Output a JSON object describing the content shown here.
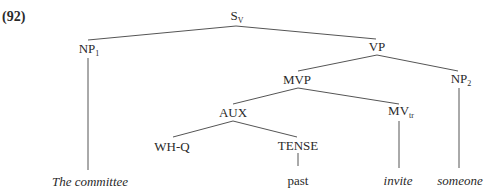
{
  "example_number": "(92)",
  "nodes": {
    "S": {
      "base": "S",
      "sub": "V"
    },
    "NP1": {
      "base": "NP",
      "sub": "1"
    },
    "VP": {
      "base": "VP",
      "sub": ""
    },
    "MVP": {
      "base": "MVP",
      "sub": ""
    },
    "NP2": {
      "base": "NP",
      "sub": "2"
    },
    "AUX": {
      "base": "AUX",
      "sub": ""
    },
    "MVtr": {
      "base": "MV",
      "sub": "tr"
    },
    "WHQ": {
      "base": "WH-Q",
      "sub": ""
    },
    "TENSE": {
      "base": "TENSE",
      "sub": ""
    }
  },
  "leaves": {
    "np1": "The committee",
    "tense": "past",
    "mv": "invite",
    "np2": "someone"
  },
  "edges": [
    [
      "S",
      "NP1"
    ],
    [
      "S",
      "VP"
    ],
    [
      "VP",
      "MVP"
    ],
    [
      "VP",
      "NP2"
    ],
    [
      "MVP",
      "AUX"
    ],
    [
      "MVP",
      "MVtr"
    ],
    [
      "AUX",
      "WHQ"
    ],
    [
      "AUX",
      "TENSE"
    ],
    [
      "NP1",
      "The committee"
    ],
    [
      "TENSE",
      "past"
    ],
    [
      "MVtr",
      "invite"
    ],
    [
      "NP2",
      "someone"
    ]
  ],
  "colors": {
    "line": "#555555",
    "text": "#2a2a2a"
  }
}
